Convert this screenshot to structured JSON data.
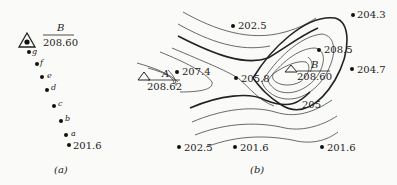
{
  "panel_a": {
    "caption": "(a)",
    "station": {
      "name": "B",
      "elevation": "208.60"
    },
    "points": [
      {
        "label": "g"
      },
      {
        "label": "f"
      },
      {
        "label": "e"
      },
      {
        "label": "d"
      },
      {
        "label": "c"
      },
      {
        "label": "b"
      },
      {
        "label": "a"
      },
      {
        "label": "201.6"
      }
    ]
  },
  "panel_b": {
    "caption": "(b)",
    "station_a": {
      "name": "A",
      "elevation": "208.62"
    },
    "station_b": {
      "name": "B",
      "elevation": "208.60"
    },
    "contour_label": "205",
    "spot_heights": [
      {
        "id": "s1",
        "value": "202.5"
      },
      {
        "id": "s2",
        "value": "204.3"
      },
      {
        "id": "s3",
        "value": "207.4"
      },
      {
        "id": "s4",
        "value": "205.8"
      },
      {
        "id": "s5",
        "value": "208.5"
      },
      {
        "id": "s6",
        "value": "204.7"
      },
      {
        "id": "s7",
        "value": "202.5"
      },
      {
        "id": "s8",
        "value": "201.6"
      },
      {
        "id": "s9",
        "value": "201.6"
      }
    ]
  }
}
